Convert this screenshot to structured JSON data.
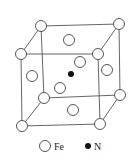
{
  "diagram": {
    "type": "crystal-unit-cell",
    "legend": [
      {
        "symbol": "open-circle",
        "label": "Fe"
      },
      {
        "symbol": "filled-circle",
        "label": "N"
      }
    ],
    "colors": {
      "edge": "#555555",
      "fe_fill": "#ffffff",
      "fe_stroke": "#444444",
      "n_fill": "#111111"
    }
  }
}
